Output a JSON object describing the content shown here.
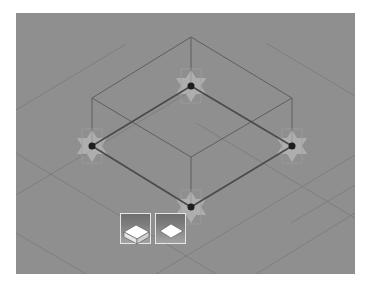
{
  "viewport": {
    "name": "3D modeling viewport",
    "background_color": "#8f8f8f",
    "view": "isometric"
  },
  "shape": {
    "type": "box-wireframe",
    "base_vertices": [
      {
        "id": "top",
        "label": "vertex-handle-top"
      },
      {
        "id": "left",
        "label": "vertex-handle-left"
      },
      {
        "id": "right",
        "label": "vertex-handle-right"
      },
      {
        "id": "bottom",
        "label": "vertex-handle-bottom"
      }
    ],
    "edge_color": "#555555",
    "handle_color": "#1e1e1e",
    "gizmo_color": "#c8c8c8"
  },
  "toolbar": {
    "buttons": [
      {
        "id": "extrude",
        "icon": "extruded-slab-icon",
        "tooltip": ""
      },
      {
        "id": "plane",
        "icon": "flat-plane-icon",
        "tooltip": ""
      }
    ]
  }
}
